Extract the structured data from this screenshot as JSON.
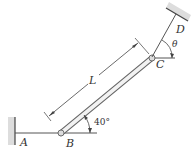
{
  "diagram": {
    "type": "statics-rod-cable",
    "labels": {
      "A": "A",
      "B": "B",
      "C": "C",
      "D": "D",
      "theta": "θ",
      "length": "L",
      "angle_B": "40°"
    },
    "colors": {
      "line": "#444444",
      "rod_fill": "#f2f2f2",
      "hatch": "#bbbbbb",
      "background": "#ffffff"
    },
    "elements": [
      "wall support at A",
      "horizontal cable A to B",
      "rod B to C at 40° from horizontal",
      "cable C to D at angle θ from horizontal",
      "ceiling support at D",
      "dimension L along rod"
    ]
  }
}
